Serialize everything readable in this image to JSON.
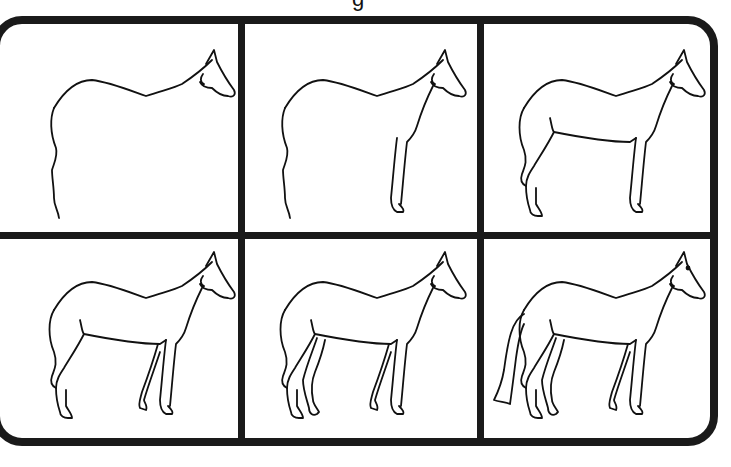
{
  "title": {
    "partial_glyph": "g"
  },
  "tutorial": {
    "subject": "horse",
    "layout": {
      "rows": 2,
      "columns": 3
    },
    "colors": {
      "frame": "#1a1a1a",
      "line": "#111111",
      "background": "#ffffff"
    },
    "steps": [
      {
        "step": 1,
        "parts": [
          "outline-back",
          "head",
          "rear-rough"
        ]
      },
      {
        "step": 2,
        "parts": [
          "outline-back",
          "head",
          "rear-rough",
          "front-leg-near"
        ]
      },
      {
        "step": 3,
        "parts": [
          "outline-back",
          "head",
          "rear-refined",
          "front-leg-near",
          "hind-leg-near",
          "belly"
        ]
      },
      {
        "step": 4,
        "parts": [
          "outline-back",
          "head",
          "rear-refined",
          "front-leg-near",
          "hind-leg-near",
          "belly",
          "front-leg-far"
        ]
      },
      {
        "step": 5,
        "parts": [
          "outline-back",
          "head",
          "rear-refined",
          "front-leg-near",
          "hind-leg-near",
          "belly",
          "front-leg-far",
          "hind-leg-far"
        ]
      },
      {
        "step": 6,
        "parts": [
          "outline-back",
          "head",
          "rear-refined",
          "front-leg-near",
          "hind-leg-near",
          "belly",
          "front-leg-far",
          "hind-leg-far",
          "tail",
          "eye"
        ]
      }
    ]
  }
}
